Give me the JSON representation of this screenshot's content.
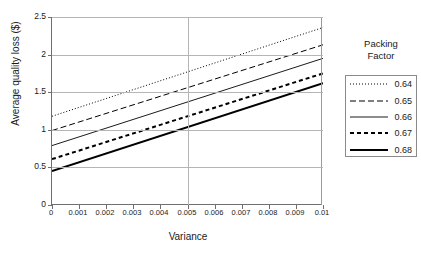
{
  "chart_data": {
    "type": "line",
    "title": "",
    "xlabel": "Variance",
    "ylabel": "Average quality loss ($)",
    "xlim": [
      0,
      0.01
    ],
    "ylim": [
      0,
      2.5
    ],
    "xticks": [
      "0",
      "0.001",
      "0.002",
      "0.003",
      "0.004",
      "0.005",
      "0.006",
      "0.007",
      "0.008",
      "0.009",
      "0.01"
    ],
    "xtick_values": [
      0,
      0.001,
      0.002,
      0.003,
      0.004,
      0.005,
      0.006,
      0.007,
      0.008,
      0.009,
      0.01
    ],
    "yticks": [
      "0",
      "0.5",
      "1",
      "1.5",
      "2",
      "2.5"
    ],
    "ytick_values": [
      0,
      0.5,
      1,
      1.5,
      2,
      2.5
    ],
    "grid": "horizontal-and-vertical-at-0.005",
    "legend_position": "right",
    "legend_title": "Packing Factor",
    "x": [
      0,
      0.01
    ],
    "series": [
      {
        "name": "0.64",
        "values": [
          1.18,
          2.36
        ],
        "style": "dotted",
        "width": 1.0
      },
      {
        "name": "0.65",
        "values": [
          0.99,
          2.13
        ],
        "style": "dashdot",
        "width": 1.0
      },
      {
        "name": "0.66",
        "values": [
          0.79,
          1.95
        ],
        "style": "solid",
        "width": 0.9
      },
      {
        "name": "0.67",
        "values": [
          0.61,
          1.75
        ],
        "style": "dashed",
        "width": 2.0
      },
      {
        "name": "0.68",
        "values": [
          0.45,
          1.62
        ],
        "style": "solid",
        "width": 2.0
      }
    ]
  },
  "legend": {
    "title_line1": "Packing",
    "title_line2": "Factor",
    "entries": [
      {
        "label": "0.64"
      },
      {
        "label": "0.65"
      },
      {
        "label": "0.66"
      },
      {
        "label": "0.67"
      },
      {
        "label": "0.68"
      }
    ]
  },
  "axes": {
    "y_title": "Average quality loss ($)",
    "x_title": "Variance",
    "y_ticklabels": [
      "2.5",
      "2",
      "1.5",
      "1",
      "0.5",
      "0"
    ],
    "x_ticklabels": [
      "0",
      "0.001",
      "0.002",
      "0.003",
      "0.004",
      "0.005",
      "0.006",
      "0.007",
      "0.008",
      "0.009",
      "0.01"
    ]
  },
  "colors": {
    "line": "#000000",
    "grid": "#b5b5b5",
    "axis": "#6f6f6f",
    "text": "#1a1a1a",
    "background": "#ffffff"
  }
}
